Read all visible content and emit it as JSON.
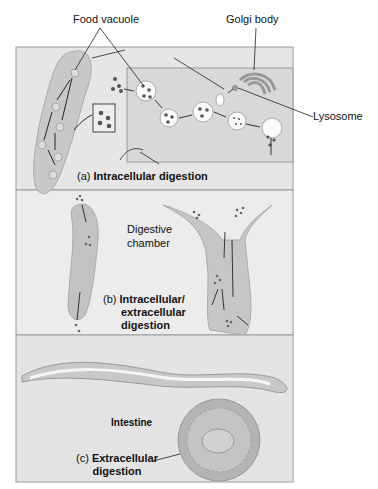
{
  "labels": {
    "food_vacuole": "Food vacuole",
    "golgi_body": "Golgi body",
    "lysosome": "Lysosome",
    "digestive_chamber_1": "Digestive",
    "digestive_chamber_2": "chamber",
    "intestine": "Intestine"
  },
  "panels": [
    {
      "letter": "(a)",
      "title": "Intracellular digestion"
    },
    {
      "letter": "(b)",
      "title_lines": [
        "Intracellular/",
        "extracellular",
        "digestion"
      ]
    },
    {
      "letter": "(c)",
      "title_lines": [
        "Extracellular",
        "digestion"
      ]
    }
  ],
  "colors": {
    "panel_bg": "#e6e6e6",
    "inset_bg": "#dcdcdc",
    "organism": "#c4c4c4",
    "organism_dark": "#a8a8a8",
    "particle": "#555555",
    "frame": "#9a9a9a"
  }
}
